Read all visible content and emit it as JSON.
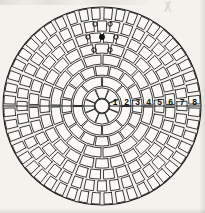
{
  "figure": {
    "background_color": "#f4f2ed",
    "ink_color": "#1a1a1a",
    "cell_fill": "#fbfaf7"
  },
  "chart_data": {
    "type": "polar-grid",
    "title": "",
    "subtitle": "",
    "xlabel": "",
    "ylabel": "",
    "grid": true,
    "legend": "none",
    "center": {
      "x": 102,
      "y": 106
    },
    "hub_radius": 7,
    "outer_radius": 99,
    "ring_count": 8,
    "ring_labels": [
      "1",
      "2",
      "3",
      "4",
      "5",
      "6",
      "7",
      "8"
    ],
    "ring_label_axis": "right-horizontal",
    "ring_radii": [
      7,
      19,
      30,
      41,
      52,
      63,
      74,
      86,
      99
    ],
    "ring_sector_counts": [
      8,
      8,
      16,
      16,
      24,
      32,
      40,
      48
    ],
    "axis_line": {
      "present": true,
      "orientation": "horizontal",
      "through_center": true
    },
    "markers": [
      {
        "id": "m1",
        "kind": "open-circle",
        "ring": 7,
        "position": "top-left",
        "x": 95,
        "y": 24
      },
      {
        "id": "m2",
        "kind": "open-circle",
        "ring": 7,
        "position": "top-right",
        "x": 110,
        "y": 24
      },
      {
        "id": "m3",
        "kind": "open-circle",
        "ring": 6,
        "position": "mid-left",
        "x": 88,
        "y": 37
      },
      {
        "id": "m4",
        "kind": "filled-dot",
        "ring": 6,
        "position": "mid-center",
        "x": 102,
        "y": 37
      },
      {
        "id": "m5",
        "kind": "open-circle",
        "ring": 6,
        "position": "mid-right",
        "x": 116,
        "y": 37
      },
      {
        "id": "m6",
        "kind": "open-circle",
        "ring": 5,
        "position": "low-left",
        "x": 94,
        "y": 50
      },
      {
        "id": "m7",
        "kind": "open-circle",
        "ring": 5,
        "position": "low-right",
        "x": 110,
        "y": 50
      }
    ],
    "marker_legend": {
      "filled-dot": "target / center point",
      "open-circle": "surrounding marked cell"
    }
  },
  "annotations": {
    "scan_artifact_top": "",
    "scan_artifact_corner": ""
  }
}
